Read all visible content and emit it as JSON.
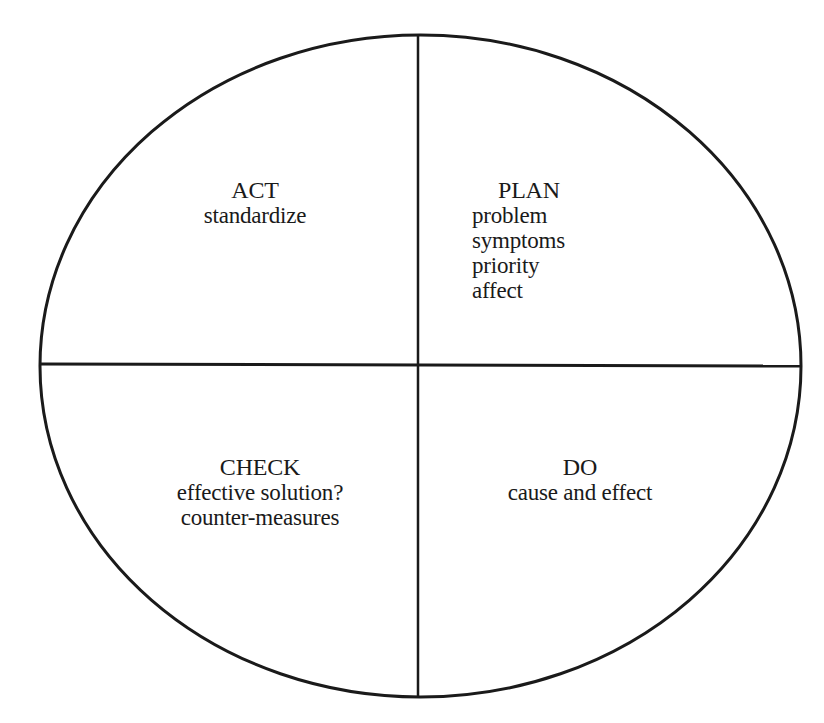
{
  "diagram": {
    "type": "PDCA cycle",
    "quadrants": {
      "act": {
        "title": "ACT",
        "items": [
          "standardize"
        ]
      },
      "plan": {
        "title": "PLAN",
        "items": [
          "problem",
          "symptoms",
          "priority",
          "affect"
        ]
      },
      "check": {
        "title": "CHECK",
        "items": [
          "effective solution?",
          "counter-measures"
        ]
      },
      "do": {
        "title": "DO",
        "items": [
          "cause and effect"
        ]
      }
    },
    "colors": {
      "stroke": "#1a1a1a",
      "background": "#ffffff"
    }
  }
}
